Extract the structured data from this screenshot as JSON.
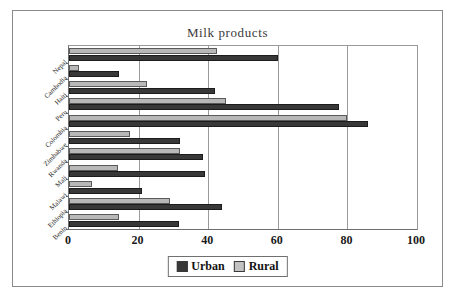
{
  "chart_data": {
    "type": "bar",
    "orientation": "horizontal",
    "title": "Milk products",
    "xlabel": "",
    "ylabel": "",
    "xlim": [
      0,
      100
    ],
    "xticks": [
      0,
      20,
      40,
      60,
      80,
      100
    ],
    "grid": true,
    "legend_position": "bottom",
    "categories": [
      "Nepal",
      "Cambodia",
      "Haiti",
      "Peru",
      "Colombia",
      "Zimbabwe",
      "Rwanda",
      "Mali",
      "Malawi",
      "Ethiopia",
      "Benin"
    ],
    "series": [
      {
        "name": "Urban",
        "color": "#383838",
        "values": [
          60,
          14.5,
          42,
          77.5,
          86,
          32,
          38.5,
          39,
          21,
          44,
          31.5
        ]
      },
      {
        "name": "Rural",
        "color": "#b8b8b8",
        "values": [
          42.5,
          3,
          22.5,
          45,
          80,
          17.5,
          32,
          14,
          6.5,
          29,
          14.5
        ]
      }
    ]
  },
  "legend": {
    "items": [
      {
        "label": "Urban",
        "swatch": "urban"
      },
      {
        "label": "Rural",
        "swatch": "rural"
      }
    ]
  }
}
